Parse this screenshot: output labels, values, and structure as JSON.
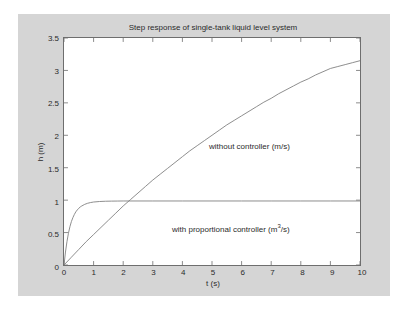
{
  "chart_data": {
    "type": "line",
    "title": "Step response of single-tank liquid level system",
    "xlabel": "t (s)",
    "ylabel": "h (m)",
    "xlim": [
      0,
      10
    ],
    "ylim": [
      0,
      3.5
    ],
    "xticks": [
      "0",
      "1",
      "2",
      "3",
      "4",
      "5",
      "6",
      "7",
      "8",
      "9",
      "10"
    ],
    "xtick_values": [
      0,
      1,
      2,
      3,
      4,
      5,
      6,
      7,
      8,
      9,
      10
    ],
    "yticks": [
      "0",
      "0.5",
      "1",
      "1.5",
      "2",
      "2.5",
      "3",
      "3.5"
    ],
    "ytick_values": [
      0,
      0.5,
      1,
      1.5,
      2,
      2.5,
      3,
      3.5
    ],
    "grid": false,
    "legend": "annotations-inline",
    "line_color": "#808080",
    "axes_color": "#6e6e6e",
    "plot_bgcolor": "#ffffff",
    "figure_bgcolor": "#d5d5d5",
    "annotations": [
      {
        "text": "without controller (m/s)",
        "x": 5.0,
        "y": 2.02
      },
      {
        "text": "with proportional controller (m",
        "sup": "3",
        "text_tail": "/s)",
        "x": 3.2,
        "y": 0.72
      }
    ],
    "series": [
      {
        "name": "without controller (m/s)",
        "x": [
          0,
          0.25,
          0.5,
          0.75,
          1,
          1.25,
          1.5,
          1.75,
          2,
          2.25,
          2.5,
          2.75,
          3,
          3.25,
          3.5,
          3.75,
          4,
          4.25,
          4.5,
          4.75,
          5,
          5.25,
          5.5,
          5.75,
          6,
          6.25,
          6.5,
          6.75,
          7,
          7.25,
          7.5,
          7.75,
          8,
          8.25,
          8.5,
          8.75,
          9,
          9.25,
          9.5,
          9.75,
          10
        ],
        "values": [
          0,
          0.12,
          0.24,
          0.36,
          0.47,
          0.58,
          0.69,
          0.8,
          0.91,
          1.01,
          1.11,
          1.21,
          1.31,
          1.4,
          1.49,
          1.58,
          1.67,
          1.76,
          1.84,
          1.92,
          2.0,
          2.08,
          2.16,
          2.23,
          2.3,
          2.37,
          2.44,
          2.51,
          2.57,
          2.64,
          2.7,
          2.76,
          2.82,
          2.87,
          2.93,
          2.98,
          3.03,
          3.06,
          3.09,
          3.12,
          3.15
        ]
      },
      {
        "name": "with proportional controller (m^3/s)",
        "x": [
          0,
          0.05,
          0.1,
          0.15,
          0.2,
          0.25,
          0.3,
          0.35,
          0.4,
          0.45,
          0.5,
          0.55,
          0.6,
          0.7,
          0.8,
          0.9,
          1.0,
          1.2,
          1.4,
          1.6,
          1.8,
          2.0,
          2.5,
          3.0,
          4.0,
          5.0,
          6.0,
          7.0,
          8.0,
          9.0,
          10.0
        ],
        "values": [
          0,
          0.2,
          0.36,
          0.49,
          0.59,
          0.67,
          0.73,
          0.78,
          0.82,
          0.85,
          0.875,
          0.895,
          0.91,
          0.935,
          0.952,
          0.963,
          0.971,
          0.979,
          0.983,
          0.985,
          0.986,
          0.987,
          0.987,
          0.987,
          0.987,
          0.987,
          0.987,
          0.987,
          0.987,
          0.987,
          0.987
        ]
      }
    ]
  }
}
